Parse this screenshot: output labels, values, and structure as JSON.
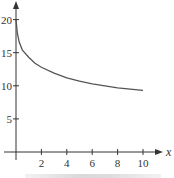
{
  "chart_data": {
    "type": "line",
    "title": "",
    "xlabel": "x",
    "ylabel": "",
    "xlim": [
      0,
      10.8
    ],
    "ylim": [
      0,
      21.5
    ],
    "x_ticks": [
      "2",
      "4",
      "6",
      "8",
      "10"
    ],
    "y_ticks": [
      "5",
      "10",
      "15",
      "20"
    ],
    "grid": false,
    "legend": null,
    "series": [
      {
        "name": "curve",
        "x": [
          0,
          0.1,
          0.25,
          0.5,
          1,
          1.5,
          2,
          3,
          4,
          5,
          6,
          7,
          8,
          9,
          10
        ],
        "values": [
          20,
          18.0,
          16.6,
          15.4,
          14.3,
          13.4,
          12.8,
          11.9,
          11.2,
          10.7,
          10.3,
          10.0,
          9.7,
          9.5,
          9.3
        ]
      }
    ]
  },
  "colors": {
    "axis": "#333333",
    "curve": "#555555"
  }
}
